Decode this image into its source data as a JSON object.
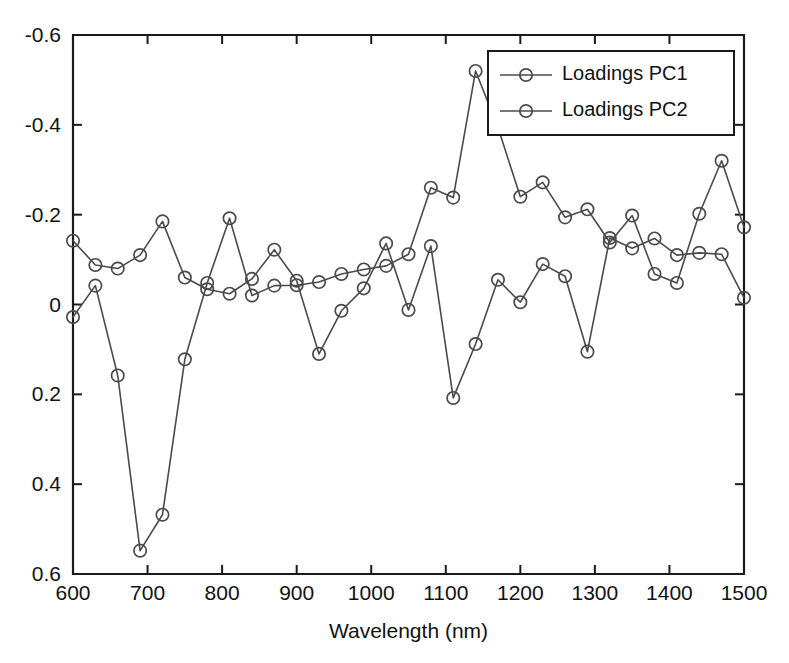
{
  "chart_data": {
    "type": "line",
    "title": "",
    "xlabel": "Wavelength (nm)",
    "ylabel": "",
    "xlim": [
      600,
      1500
    ],
    "ylim": [
      -0.6,
      0.6
    ],
    "xticks": [
      600,
      700,
      800,
      900,
      1000,
      1100,
      1200,
      1300,
      1400,
      1500
    ],
    "yticks": [
      -0.6,
      -0.4,
      -0.2,
      0,
      0.2,
      0.4,
      0.6
    ],
    "xtick_labels": [
      "600",
      "700",
      "800",
      "900",
      "1000",
      "1100",
      "1200",
      "1300",
      "1400",
      "1500"
    ],
    "ytick_labels": [
      "0.6",
      "0.4",
      "0.2",
      "0",
      "-0.2",
      "-0.4",
      "-0.6"
    ],
    "grid": false,
    "legend_position": "top-right",
    "marker": "circle-open",
    "line_color": "#4a4a4a",
    "axis_color": "#1a1a1a",
    "x": [
      600,
      630,
      660,
      690,
      720,
      750,
      780,
      810,
      840,
      870,
      900,
      930,
      960,
      990,
      1020,
      1050,
      1080,
      1110,
      1140,
      1170,
      1200,
      1230,
      1260,
      1290,
      1320,
      1350,
      1380,
      1410,
      1440,
      1470,
      1500
    ],
    "series": [
      {
        "name": "Loadings PC1",
        "values": [
          0.142,
          0.088,
          0.08,
          0.11,
          0.185,
          0.06,
          0.034,
          0.024,
          0.057,
          0.122,
          0.053,
          -0.11,
          -0.014,
          0.036,
          0.136,
          -0.012,
          0.13,
          -0.208,
          -0.088,
          0.055,
          0.005,
          0.09,
          0.063,
          -0.105,
          0.148,
          0.125,
          0.147,
          0.11,
          0.115,
          0.112,
          0.015
        ]
      },
      {
        "name": "Loadings PC2",
        "values": [
          -0.028,
          0.042,
          -0.158,
          -0.548,
          -0.468,
          -0.122,
          0.048,
          0.192,
          0.02,
          0.042,
          0.043,
          0.05,
          0.068,
          0.078,
          0.086,
          0.112,
          0.26,
          0.238,
          0.52,
          0.394,
          0.24,
          0.272,
          0.194,
          0.212,
          0.138,
          0.198,
          0.068,
          0.048,
          0.202,
          0.32,
          0.172
        ]
      }
    ],
    "legend": [
      {
        "label": "Loadings PC1"
      },
      {
        "label": "Loadings PC2"
      }
    ]
  }
}
